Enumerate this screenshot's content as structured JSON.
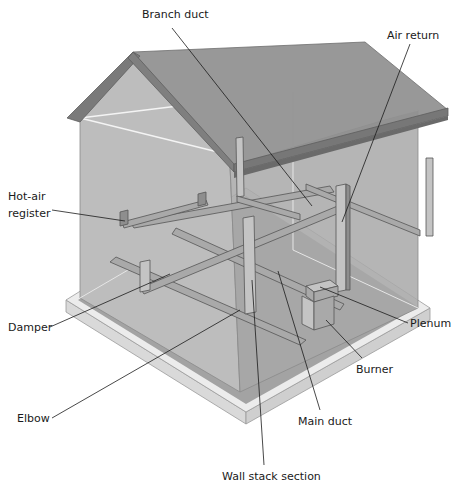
{
  "colors": {
    "background": "#ffffff",
    "wall_left": "#bdbdbd",
    "wall_front": "#a8a8a8",
    "roof": "#8f8f8f",
    "roof_trim": "#777777",
    "slab": "#e8e8e8",
    "duct": "#a9a9a9",
    "leader_line": "#1a1a1a"
  },
  "labels": [
    {
      "id": "branch-duct",
      "text": "Branch duct"
    },
    {
      "id": "air-return",
      "text": "Air return"
    },
    {
      "id": "hot-air-register-1",
      "text": "Hot-air"
    },
    {
      "id": "hot-air-register-2",
      "text": "register"
    },
    {
      "id": "damper",
      "text": "Damper"
    },
    {
      "id": "plenum",
      "text": "Plenum"
    },
    {
      "id": "burner",
      "text": "Burner"
    },
    {
      "id": "elbow",
      "text": "Elbow"
    },
    {
      "id": "main-duct",
      "text": "Main duct"
    },
    {
      "id": "wall-stack-section",
      "text": "Wall stack section"
    }
  ]
}
